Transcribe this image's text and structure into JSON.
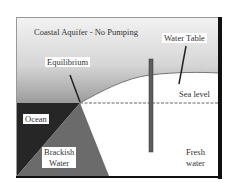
{
  "title": "Coastal Aquifer - No Pumping",
  "labels": {
    "water_table": "Water Table",
    "equilibrium": "Equilibrium",
    "sea_level": "Sea level",
    "ocean": "Ocean",
    "brackish_line1": "Brackish",
    "brackish_line2": "Water",
    "fresh_line1": "Fresh",
    "fresh_line2": "water"
  },
  "colors": {
    "sky_top": "#e2e2e2",
    "sky_bottom": "#9a9a9a",
    "ocean": "#2b2b2b",
    "brackish": "#6e6e6e",
    "fresh": "#ffffff",
    "well": "#5a5a5a",
    "frame": "#111111"
  }
}
